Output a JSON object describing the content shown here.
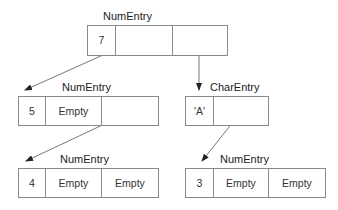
{
  "diagram": {
    "nodes": [
      {
        "id": "n1",
        "type": "NumEntry",
        "cells": [
          "7",
          "",
          ""
        ]
      },
      {
        "id": "n2",
        "type": "NumEntry",
        "cells": [
          "5",
          "Empty",
          ""
        ]
      },
      {
        "id": "n3",
        "type": "CharEntry",
        "cells": [
          "'A'",
          ""
        ]
      },
      {
        "id": "n4",
        "type": "NumEntry",
        "cells": [
          "4",
          "Empty",
          "Empty"
        ]
      },
      {
        "id": "n5",
        "type": "NumEntry",
        "cells": [
          "3",
          "Empty",
          "Empty"
        ]
      }
    ],
    "edges": [
      {
        "from": "n1",
        "cell": 1,
        "to": "n2"
      },
      {
        "from": "n1",
        "cell": 2,
        "to": "n3"
      },
      {
        "from": "n2",
        "cell": 2,
        "to": "n4"
      },
      {
        "from": "n3",
        "cell": 1,
        "to": "n5"
      }
    ]
  }
}
